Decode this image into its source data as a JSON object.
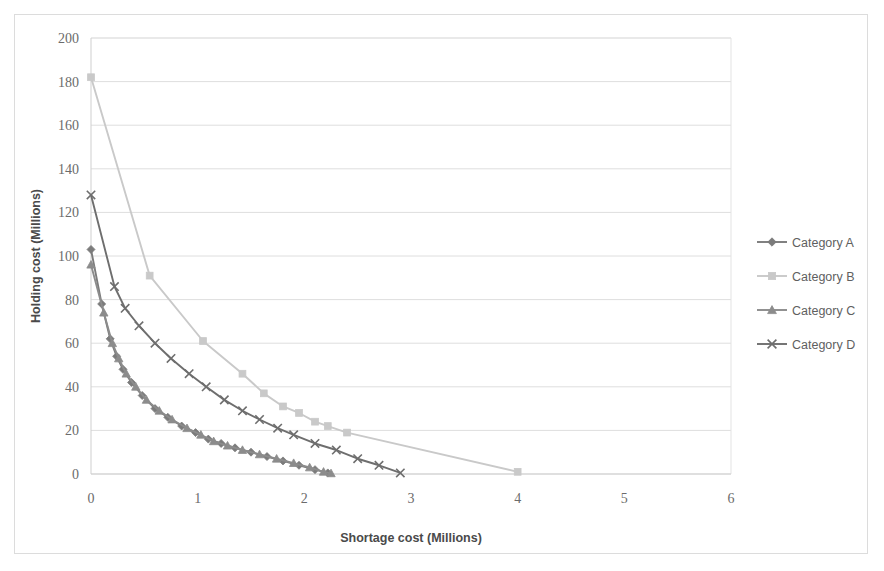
{
  "chart_data": {
    "type": "line",
    "title": "",
    "xlabel": "Shortage cost (Millions)",
    "ylabel": "Holding cost (Millions)",
    "xlim": [
      0,
      6
    ],
    "ylim": [
      0,
      200
    ],
    "xticks": [
      "0",
      "1",
      "2",
      "3",
      "4",
      "5",
      "6"
    ],
    "yticks": [
      "0",
      "20",
      "40",
      "60",
      "80",
      "100",
      "120",
      "140",
      "160",
      "180",
      "200"
    ],
    "grid": "horizontal",
    "legend_position": "right",
    "series": [
      {
        "name": "Category A",
        "color": "#7b7b7b",
        "marker": "diamond",
        "points": [
          [
            0.0,
            103
          ],
          [
            0.1,
            78
          ],
          [
            0.18,
            62
          ],
          [
            0.24,
            54
          ],
          [
            0.3,
            48
          ],
          [
            0.38,
            42
          ],
          [
            0.48,
            36
          ],
          [
            0.6,
            30
          ],
          [
            0.72,
            26
          ],
          [
            0.85,
            22
          ],
          [
            0.98,
            19
          ],
          [
            1.1,
            16
          ],
          [
            1.22,
            14
          ],
          [
            1.35,
            12
          ],
          [
            1.5,
            10
          ],
          [
            1.65,
            8
          ],
          [
            1.8,
            6
          ],
          [
            1.95,
            4
          ],
          [
            2.1,
            2
          ],
          [
            2.22,
            0.5
          ]
        ]
      },
      {
        "name": "Category B",
        "color": "#c9c9c9",
        "marker": "square",
        "points": [
          [
            0.0,
            182
          ],
          [
            0.55,
            91
          ],
          [
            1.05,
            61
          ],
          [
            1.42,
            46
          ],
          [
            1.62,
            37
          ],
          [
            1.8,
            31
          ],
          [
            1.95,
            28
          ],
          [
            2.1,
            24
          ],
          [
            2.22,
            22
          ],
          [
            2.4,
            19
          ],
          [
            4.0,
            1
          ]
        ]
      },
      {
        "name": "Category C",
        "color": "#8c8c8c",
        "marker": "triangle",
        "points": [
          [
            0.0,
            96
          ],
          [
            0.12,
            74
          ],
          [
            0.2,
            60
          ],
          [
            0.26,
            53
          ],
          [
            0.33,
            46
          ],
          [
            0.42,
            40
          ],
          [
            0.52,
            34
          ],
          [
            0.64,
            29
          ],
          [
            0.76,
            25
          ],
          [
            0.9,
            21
          ],
          [
            1.03,
            18
          ],
          [
            1.15,
            15
          ],
          [
            1.28,
            13
          ],
          [
            1.42,
            11
          ],
          [
            1.58,
            9
          ],
          [
            1.74,
            7
          ],
          [
            1.9,
            5
          ],
          [
            2.05,
            3
          ],
          [
            2.18,
            1
          ],
          [
            2.25,
            0.3
          ]
        ]
      },
      {
        "name": "Category D",
        "color": "#6e6e6e",
        "marker": "x",
        "points": [
          [
            0.0,
            128
          ],
          [
            0.22,
            86
          ],
          [
            0.32,
            76
          ],
          [
            0.45,
            68
          ],
          [
            0.6,
            60
          ],
          [
            0.75,
            53
          ],
          [
            0.92,
            46
          ],
          [
            1.08,
            40
          ],
          [
            1.25,
            34
          ],
          [
            1.42,
            29
          ],
          [
            1.58,
            25
          ],
          [
            1.75,
            21
          ],
          [
            1.9,
            18
          ],
          [
            2.1,
            14
          ],
          [
            2.3,
            11
          ],
          [
            2.5,
            7
          ],
          [
            2.7,
            4
          ],
          [
            2.9,
            0.5
          ]
        ]
      }
    ]
  }
}
